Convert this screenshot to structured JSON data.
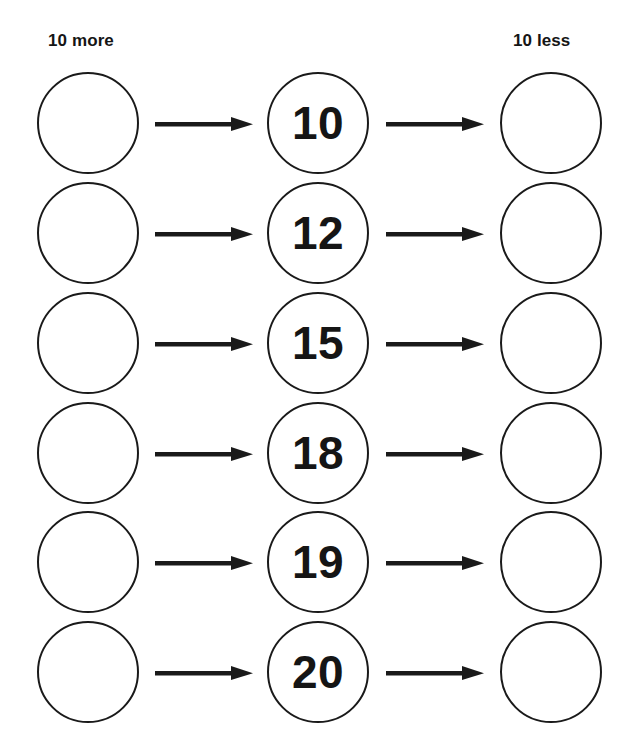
{
  "worksheet": {
    "columns": {
      "left_label": "10 more",
      "right_label": "10 less"
    },
    "rows": [
      {
        "number": "10",
        "more_answer": "",
        "less_answer": ""
      },
      {
        "number": "12",
        "more_answer": "",
        "less_answer": ""
      },
      {
        "number": "15",
        "more_answer": "",
        "less_answer": ""
      },
      {
        "number": "18",
        "more_answer": "",
        "less_answer": ""
      },
      {
        "number": "19",
        "more_answer": "",
        "less_answer": ""
      },
      {
        "number": "20",
        "more_answer": "",
        "less_answer": ""
      }
    ],
    "icons": {
      "arrow": "arrow-right-icon"
    },
    "colors": {
      "ink": "#151515",
      "circle_border": "#1a1a1a",
      "background": "#ffffff"
    }
  }
}
